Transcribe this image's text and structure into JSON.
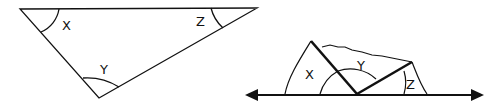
{
  "figure": {
    "left_triangle": {
      "angle_labels": {
        "x": "X",
        "y": "Y",
        "z": "Z"
      }
    },
    "right_figure": {
      "angle_labels": {
        "x": "X",
        "y": "Y",
        "z": "Z"
      },
      "description": "Torn corners of triangle placed along a straight line"
    }
  },
  "colors": {
    "stroke": "#111111",
    "background": "#ffffff"
  }
}
